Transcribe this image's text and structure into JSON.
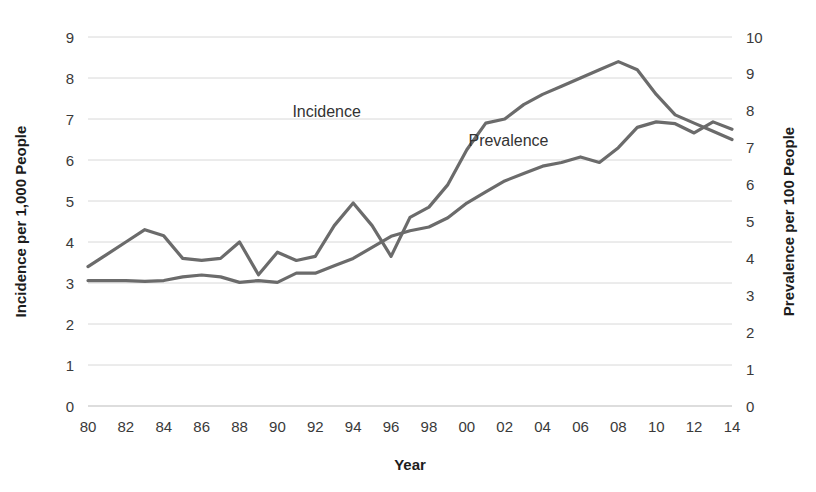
{
  "chart_data": {
    "type": "line",
    "title": "",
    "xlabel": "Year",
    "ylabel": "Incidence per 1,000 People",
    "y2label": "Prevalence per 100 People",
    "xlim": [
      1980,
      2014
    ],
    "ylim": [
      0,
      9
    ],
    "y2lim": [
      0,
      10
    ],
    "grid": true,
    "legend_position": "inline-annotations",
    "x": [
      1980,
      1981,
      1982,
      1983,
      1984,
      1985,
      1986,
      1987,
      1988,
      1989,
      1990,
      1991,
      1992,
      1993,
      1994,
      1995,
      1996,
      1997,
      1998,
      1999,
      2000,
      2001,
      2002,
      2003,
      2004,
      2005,
      2006,
      2007,
      2008,
      2009,
      2010,
      2011,
      2012,
      2013,
      2014
    ],
    "xtick_labels": [
      "80",
      "82",
      "84",
      "86",
      "88",
      "90",
      "92",
      "94",
      "96",
      "98",
      "00",
      "02",
      "04",
      "06",
      "08",
      "10",
      "12",
      "14"
    ],
    "xtick_values": [
      1980,
      1982,
      1984,
      1986,
      1988,
      1990,
      1992,
      1994,
      1996,
      1998,
      2000,
      2002,
      2004,
      2006,
      2008,
      2010,
      2012,
      2014
    ],
    "ytick_labels": [
      "0",
      "1",
      "2",
      "3",
      "4",
      "5",
      "6",
      "7",
      "8",
      "9"
    ],
    "ytick_values": [
      0,
      1,
      2,
      3,
      4,
      5,
      6,
      7,
      8,
      9
    ],
    "y2tick_labels": [
      "0",
      "1",
      "2",
      "3",
      "4",
      "5",
      "6",
      "7",
      "8",
      "9",
      "10"
    ],
    "y2tick_values": [
      0,
      1,
      2,
      3,
      4,
      5,
      6,
      7,
      8,
      9,
      10
    ],
    "series": [
      {
        "name": "Incidence",
        "axis": "left",
        "color": "#6b6b6b",
        "width": 3.2,
        "label_x": 1992.6,
        "label_y": 7.05,
        "values": [
          3.4,
          3.7,
          4.0,
          4.3,
          4.15,
          3.6,
          3.55,
          3.6,
          4.0,
          3.2,
          3.75,
          3.55,
          3.65,
          4.4,
          4.95,
          4.4,
          3.65,
          4.6,
          4.85,
          5.4,
          6.25,
          6.9,
          7.0,
          7.35,
          7.6,
          7.8,
          8.0,
          8.2,
          8.4,
          8.2,
          7.6,
          7.1,
          6.9,
          6.7,
          6.5
        ]
      },
      {
        "name": "Prevalence",
        "axis": "right",
        "color": "#6b6b6b",
        "width": 3.2,
        "label_x": 2002.2,
        "label_y": 6.35,
        "values": [
          3.4,
          3.4,
          3.4,
          3.38,
          3.4,
          3.5,
          3.55,
          3.5,
          3.35,
          3.4,
          3.35,
          3.6,
          3.6,
          3.8,
          4.0,
          4.3,
          4.6,
          4.75,
          4.85,
          5.1,
          5.5,
          5.8,
          6.1,
          6.3,
          6.5,
          6.6,
          6.75,
          6.6,
          7.0,
          7.55,
          7.7,
          7.65,
          7.4,
          7.7,
          7.5
        ]
      }
    ]
  }
}
